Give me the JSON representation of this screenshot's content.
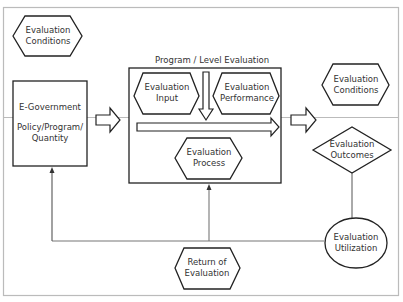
{
  "diagram": {
    "group_title": "Program / Level Evaluation",
    "nodes": {
      "conditions_left": {
        "lines": [
          "Evaluation",
          "Conditions"
        ],
        "shape": "hexagon"
      },
      "egov": {
        "lines": [
          "E-Government",
          "",
          "Policy/Program/",
          "Quantity"
        ],
        "shape": "rectangle"
      },
      "input": {
        "lines": [
          "Evaluation",
          "Input"
        ],
        "shape": "hexagon"
      },
      "performance": {
        "lines": [
          "Evaluation",
          "Performance"
        ],
        "shape": "hexagon"
      },
      "process": {
        "lines": [
          "Evaluation",
          "Process"
        ],
        "shape": "hexagon"
      },
      "conditions_right": {
        "lines": [
          "Evaluation",
          "Conditions"
        ],
        "shape": "hexagon"
      },
      "outcomes": {
        "lines": [
          "Evaluation",
          "Outcomes"
        ],
        "shape": "diamond"
      },
      "utilization": {
        "lines": [
          "Evaluation",
          "Utilization"
        ],
        "shape": "ellipse"
      },
      "return": {
        "lines": [
          "Return of",
          "Evaluation"
        ],
        "shape": "hexagon"
      }
    },
    "edges": [
      {
        "from": "egov",
        "to": "program_group",
        "style": "block-arrow"
      },
      {
        "from": "input",
        "to": "process",
        "style": "block-arrow-down"
      },
      {
        "from": "input",
        "to": "performance",
        "style": "block-arrow-right"
      },
      {
        "from": "program_group",
        "to": "conditions_right",
        "style": "block-arrow"
      },
      {
        "from": "outcomes",
        "to": "utilization",
        "style": "line"
      },
      {
        "from": "utilization",
        "to": "egov",
        "style": "arrow"
      },
      {
        "from": "utilization",
        "to": "program_group",
        "style": "arrow"
      }
    ]
  },
  "colors": {
    "stroke": "#222222",
    "feedback_line": "#777777",
    "frame": "#bbbbbb",
    "text": "#333333"
  }
}
